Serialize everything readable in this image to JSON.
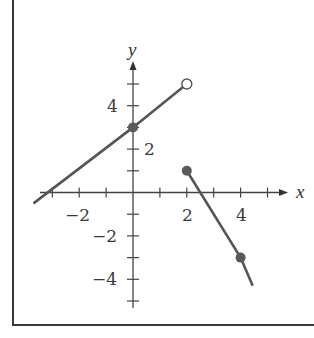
{
  "chart_data": {
    "type": "line",
    "title": "",
    "xlabel": "x",
    "ylabel": "y",
    "xlim": [
      -3.6,
      5.7
    ],
    "ylim": [
      -5.0,
      6.0
    ],
    "grid": false,
    "x_ticks": [
      -3,
      -2,
      -1,
      1,
      2,
      3,
      4,
      5
    ],
    "y_ticks": [
      -5,
      -4,
      -3,
      -2,
      -1,
      1,
      2,
      3,
      4,
      5
    ],
    "x_tick_labels": [
      {
        "value": -2,
        "text": "−2"
      },
      {
        "value": 2,
        "text": "2"
      },
      {
        "value": 4,
        "text": "4"
      }
    ],
    "y_tick_labels": [
      {
        "value": 4,
        "text": "4",
        "side": "left"
      },
      {
        "value": 2,
        "text": "2",
        "side": "right"
      },
      {
        "value": -2,
        "text": "−2",
        "side": "left"
      },
      {
        "value": -4,
        "text": "−4",
        "side": "left"
      }
    ],
    "series": [
      {
        "name": "segment-left",
        "description": "line y = x/2 + 3 for x < 2",
        "x": [
          -3.7,
          0,
          2
        ],
        "y": [
          -0.5,
          3,
          5
        ],
        "points": [
          {
            "x": 0,
            "y": 3,
            "style": "filled"
          },
          {
            "x": 2,
            "y": 5,
            "style": "open"
          }
        ]
      },
      {
        "name": "segment-right",
        "description": "line y = -2x + 5 for x >= 2",
        "x": [
          2,
          4,
          4.45
        ],
        "y": [
          1,
          -3,
          -4.3
        ],
        "points": [
          {
            "x": 2,
            "y": 1,
            "style": "filled"
          },
          {
            "x": 4,
            "y": -3,
            "style": "filled"
          }
        ]
      }
    ],
    "colors": {
      "line": "#555555",
      "point": "#5a5a5a",
      "axis": "#444444",
      "frame": "#3a3a3a"
    }
  },
  "labels": {
    "x_axis": "x",
    "y_axis": "y",
    "x_neg2": "−2",
    "x_2": "2",
    "x_4": "4",
    "y_4": "4",
    "y_2": "2",
    "y_neg2": "−2",
    "y_neg4": "−4"
  }
}
